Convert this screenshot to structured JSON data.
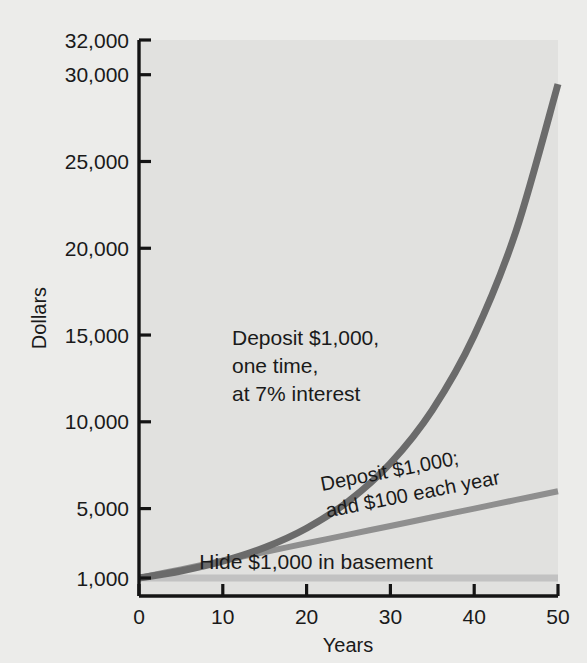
{
  "chart_data": {
    "type": "line",
    "title": "",
    "xlabel": "Years",
    "ylabel": "Dollars",
    "xlim": [
      0,
      50
    ],
    "ylim": [
      0,
      32000
    ],
    "grid": false,
    "legend_position": "inline-annotations",
    "xticks": [
      "0",
      "10",
      "20",
      "30",
      "40",
      "50"
    ],
    "xtick_values": [
      0,
      10,
      20,
      30,
      40,
      50
    ],
    "yticks": [
      "1,000",
      "5,000",
      "10,000",
      "15,000",
      "20,000",
      "25,000",
      "30,000",
      "32,000"
    ],
    "ytick_values": [
      1000,
      5000,
      10000,
      15000,
      20000,
      25000,
      30000,
      32000
    ],
    "x": [
      0,
      5,
      10,
      15,
      20,
      25,
      30,
      35,
      40,
      45,
      50
    ],
    "series": [
      {
        "name": "Deposit $1,000, one time, at 7% interest",
        "color": "#6b6b6b",
        "width": 7,
        "values": [
          1000,
          1403,
          1967,
          2759,
          3870,
          5427,
          7612,
          10677,
          14974,
          21002,
          29457
        ]
      },
      {
        "name": "Deposit $1,000; add $100 each year",
        "color": "#8f8f8f",
        "width": 6,
        "values": [
          1000,
          1500,
          2000,
          2500,
          3000,
          3500,
          4000,
          4500,
          5000,
          5500,
          6000
        ]
      },
      {
        "name": "Hide $1,000 in basement",
        "color": "#c2c2c2",
        "width": 7,
        "values": [
          1000,
          1000,
          1000,
          1000,
          1000,
          1000,
          1000,
          1000,
          1000,
          1000,
          1000
        ]
      }
    ],
    "annotations": [
      {
        "id": "annot-compound",
        "lines": [
          "Deposit $1,000,",
          "one time,",
          "at 7% interest"
        ],
        "rotation": 0
      },
      {
        "id": "annot-addyearly",
        "lines": [
          "Deposit $1,000;",
          "add $100 each year"
        ],
        "rotation": -11
      },
      {
        "id": "annot-basement",
        "lines": [
          "Hide $1,000 in basement"
        ],
        "rotation": 0
      }
    ],
    "colors": {
      "plot_background": "#e1e1df",
      "figure_background": "#ececea",
      "axis": "#141414",
      "text": "#1a1a1a"
    }
  }
}
